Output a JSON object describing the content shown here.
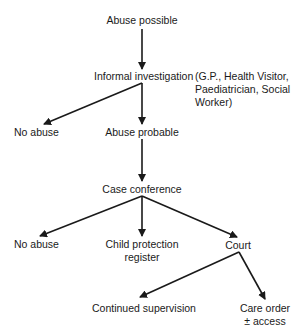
{
  "diagram": {
    "type": "flowchart",
    "nodes": {
      "abuse_possible": "Abuse possible",
      "informal_investigation": "Informal investigation",
      "investigators_note": [
        "(G.P., Health Visitor,",
        "Paediatrician, Social",
        "Worker)"
      ],
      "no_abuse_1": "No abuse",
      "abuse_probable": "Abuse probable",
      "case_conference": "Case conference",
      "no_abuse_2": "No abuse",
      "child_protection_register": [
        "Child protection",
        "register"
      ],
      "court": "Court",
      "continued_supervision": "Continued supervision",
      "care_order": [
        "Care order",
        "± access"
      ]
    },
    "edges": [
      {
        "from": "Abuse possible",
        "to": "Informal investigation"
      },
      {
        "from": "Informal investigation",
        "to": "No abuse"
      },
      {
        "from": "Informal investigation",
        "to": "Abuse probable"
      },
      {
        "from": "Abuse probable",
        "to": "Case conference"
      },
      {
        "from": "Case conference",
        "to": "No abuse"
      },
      {
        "from": "Case conference",
        "to": "Child protection register"
      },
      {
        "from": "Case conference",
        "to": "Court"
      },
      {
        "from": "Court",
        "to": "Continued supervision"
      },
      {
        "from": "Court",
        "to": "Care order ± access"
      }
    ],
    "colors": {
      "line": "#1a1a1a",
      "background": "#ffffff"
    }
  }
}
